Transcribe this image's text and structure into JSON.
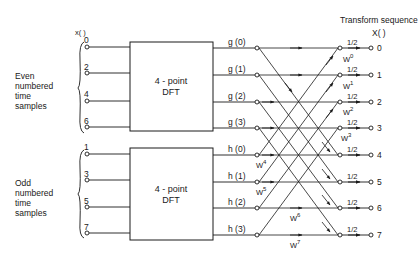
{
  "title": "Transform sequence",
  "input_label": "x(  )",
  "output_label": "X(  )",
  "groups": {
    "even": {
      "line1": "Even",
      "line2": "numbered",
      "line3": "time",
      "line4": "samples"
    },
    "odd": {
      "line1": "Odd",
      "line2": "numbered",
      "line3": "time",
      "line4": "samples"
    }
  },
  "inputs": {
    "even": [
      "0",
      "2",
      "4",
      "6"
    ],
    "odd": [
      "1",
      "3",
      "5",
      "7"
    ]
  },
  "dft_top": {
    "line1": "4 - point",
    "line2": "DFT"
  },
  "dft_bottom": {
    "line1": "4 - point",
    "line2": "DFT"
  },
  "g_outputs": [
    "g (0)",
    "g (1)",
    "g (2)",
    "g (3)"
  ],
  "h_outputs": [
    "h (0)",
    "h (1)",
    "h (2)",
    "h (3)"
  ],
  "twiddles": {
    "w0": "W",
    "e0": "0",
    "w1": "W",
    "e1": "1",
    "w2": "W",
    "e2": "2",
    "w3": "W",
    "e3": "3",
    "w4": "W",
    "e4": "4",
    "w5": "W",
    "e5": "5",
    "w6": "W",
    "e6": "6",
    "w7": "W",
    "e7": "7"
  },
  "scale_factor": "1/2",
  "outputs": [
    "0",
    "1",
    "2",
    "3",
    "4",
    "5",
    "6",
    "7"
  ]
}
